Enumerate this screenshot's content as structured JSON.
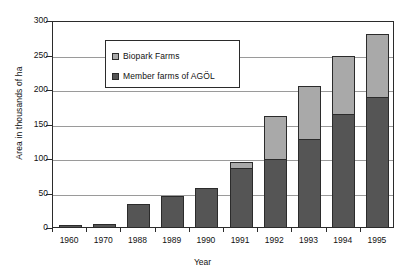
{
  "chart_data": {
    "type": "bar",
    "subtype": "stacked-bar",
    "title": "",
    "xlabel": "Year",
    "ylabel": "Area in thousands of ha",
    "categories": [
      "1960",
      "1970",
      "1988",
      "1989",
      "1990",
      "1991",
      "1992",
      "1993",
      "1994",
      "1995"
    ],
    "series": [
      {
        "name": "Member farms of AGÖL",
        "color": "#555555",
        "values": [
          3,
          4,
          34,
          45,
          56,
          85,
          99,
          128,
          164,
          188
        ]
      },
      {
        "name": "Biopark Farms",
        "color": "#a9a9a9",
        "values": [
          0,
          0,
          0,
          0,
          0,
          9,
          62,
          77,
          84,
          92
        ]
      }
    ],
    "totals": [
      3,
      4,
      34,
      45,
      56,
      94,
      161,
      205,
      248,
      280
    ],
    "ylim": [
      0,
      300
    ],
    "yticks": [
      0,
      50,
      100,
      150,
      200,
      250,
      300
    ],
    "ytick_labels": [
      "0",
      "50",
      "100",
      "150",
      "200",
      "250",
      "300"
    ],
    "grid": true,
    "grid_axis": "y",
    "legend_position": "upper-left-inside",
    "legend_entries": [
      "Biopark Farms",
      "Member farms of AGÖL"
    ]
  },
  "axes": {
    "y_title": "Area in thousands of ha",
    "x_title": "Year"
  },
  "legend": {
    "items": [
      {
        "label": "Biopark Farms",
        "swatch": "light-gray-swatch-icon"
      },
      {
        "label": "Member farms of AGÖL",
        "swatch": "dark-gray-swatch-icon"
      }
    ]
  }
}
